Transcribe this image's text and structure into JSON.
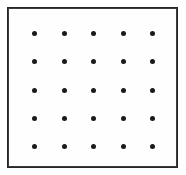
{
  "figure": {
    "background_color": "#ffffff",
    "frame": {
      "name": "square-border",
      "color": "#262626",
      "thickness_px": 2,
      "left_px": 7,
      "top_px": 7,
      "width_px": 171,
      "height_px": 161,
      "fill_color": "#fefefe"
    },
    "dots": {
      "color": "#1a1a1a",
      "shape": "circle",
      "diameter_px": 5,
      "rows": 5,
      "columns": 5,
      "total": 25,
      "column_x_px": [
        34,
        64,
        93,
        123,
        152
      ],
      "row_y_px": [
        33,
        61,
        90,
        118,
        146
      ],
      "column_spacing_px": 29.5,
      "row_spacing_px": 28.25,
      "points": [
        {
          "row": 1,
          "col": 1,
          "x": 34,
          "y": 33
        },
        {
          "row": 1,
          "col": 2,
          "x": 64,
          "y": 33
        },
        {
          "row": 1,
          "col": 3,
          "x": 93,
          "y": 33
        },
        {
          "row": 1,
          "col": 4,
          "x": 123,
          "y": 33
        },
        {
          "row": 1,
          "col": 5,
          "x": 152,
          "y": 33
        },
        {
          "row": 2,
          "col": 1,
          "x": 34,
          "y": 61
        },
        {
          "row": 2,
          "col": 2,
          "x": 64,
          "y": 61
        },
        {
          "row": 2,
          "col": 3,
          "x": 93,
          "y": 61
        },
        {
          "row": 2,
          "col": 4,
          "x": 123,
          "y": 61
        },
        {
          "row": 2,
          "col": 5,
          "x": 152,
          "y": 61
        },
        {
          "row": 3,
          "col": 1,
          "x": 34,
          "y": 90
        },
        {
          "row": 3,
          "col": 2,
          "x": 64,
          "y": 90
        },
        {
          "row": 3,
          "col": 3,
          "x": 93,
          "y": 90
        },
        {
          "row": 3,
          "col": 4,
          "x": 123,
          "y": 90
        },
        {
          "row": 3,
          "col": 5,
          "x": 152,
          "y": 90
        },
        {
          "row": 4,
          "col": 1,
          "x": 34,
          "y": 118
        },
        {
          "row": 4,
          "col": 2,
          "x": 64,
          "y": 118
        },
        {
          "row": 4,
          "col": 3,
          "x": 93,
          "y": 118
        },
        {
          "row": 4,
          "col": 4,
          "x": 123,
          "y": 118
        },
        {
          "row": 4,
          "col": 5,
          "x": 152,
          "y": 118
        },
        {
          "row": 5,
          "col": 1,
          "x": 34,
          "y": 146
        },
        {
          "row": 5,
          "col": 2,
          "x": 64,
          "y": 146
        },
        {
          "row": 5,
          "col": 3,
          "x": 93,
          "y": 146
        },
        {
          "row": 5,
          "col": 4,
          "x": 123,
          "y": 146
        },
        {
          "row": 5,
          "col": 5,
          "x": 152,
          "y": 146
        }
      ]
    }
  }
}
